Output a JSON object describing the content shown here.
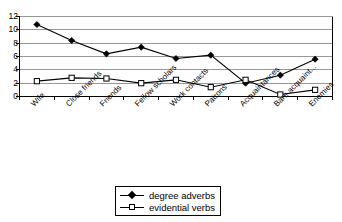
{
  "chart_data": {
    "type": "line",
    "title": "",
    "subtitle": "",
    "xlabel": "",
    "ylabel": "",
    "ylim": [
      0,
      12
    ],
    "ytick_values": [
      0,
      2,
      4,
      6,
      8,
      10,
      12
    ],
    "ytick_labels": [
      "0",
      "2",
      "4",
      "6",
      "8",
      "10",
      "12"
    ],
    "grid": "horizontal",
    "legend_position": "bottom-center",
    "categories": [
      "Wife",
      "Close friends",
      "Friends",
      "Fellow scholars",
      "Work contacts",
      "Patrons",
      "Acquaintances",
      "Bare acquaint...",
      "Enemies"
    ],
    "series": [
      {
        "name": "degree adverbs",
        "marker": "filled-diamond",
        "color": "#000000",
        "values": [
          10.8,
          8.4,
          6.4,
          7.4,
          5.7,
          6.2,
          2.0,
          3.2,
          5.6
        ]
      },
      {
        "name": "evidential verbs",
        "marker": "open-square",
        "color": "#000000",
        "values": [
          2.3,
          2.8,
          2.7,
          2.0,
          2.5,
          1.4,
          2.5,
          0.3,
          1.0
        ]
      }
    ]
  },
  "legend": {
    "items": [
      {
        "label": "degree adverbs",
        "marker": "filled-diamond"
      },
      {
        "label": "evidential verbs",
        "marker": "open-square"
      }
    ]
  },
  "axes": {
    "y_min_label": "0",
    "y_max_label": "12"
  }
}
